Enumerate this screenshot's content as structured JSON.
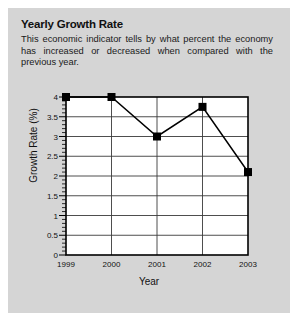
{
  "panel": {
    "background_color": "#d5d5d5",
    "border_color": "#ffffff"
  },
  "header": {
    "title": "Yearly Growth Rate",
    "description": "This economic indicator tells by what percent the economy has increased or decreased when compared with the previous year."
  },
  "chart_data": {
    "type": "line",
    "title": "Yearly Growth Rate",
    "xlabel": "Year",
    "ylabel": "Growth Rate (%)",
    "categories": [
      "1999",
      "2000",
      "2001",
      "2002",
      "2003"
    ],
    "values": [
      4.0,
      4.0,
      3.0,
      3.75,
      2.1
    ],
    "x": [
      1999,
      2000,
      2001,
      2002,
      2003
    ],
    "xlim": [
      1999,
      2003
    ],
    "ylim": [
      0,
      4
    ],
    "ytick_labels": [
      "0",
      "0.5",
      "1",
      "1.5",
      "2",
      "2.5",
      "3",
      "3.5",
      "4"
    ],
    "ytick_values": [
      0,
      0.5,
      1,
      1.5,
      2,
      2.5,
      3,
      3.5,
      4
    ],
    "minor_ticks": true,
    "minor_tick_step": 0.1,
    "grid": "horizontal-and-vertical",
    "legend": "none",
    "marker": "square",
    "marker_color": "#000000",
    "line_color": "#000000",
    "plot_background": "#ffffff",
    "frame_color": "#000000"
  }
}
